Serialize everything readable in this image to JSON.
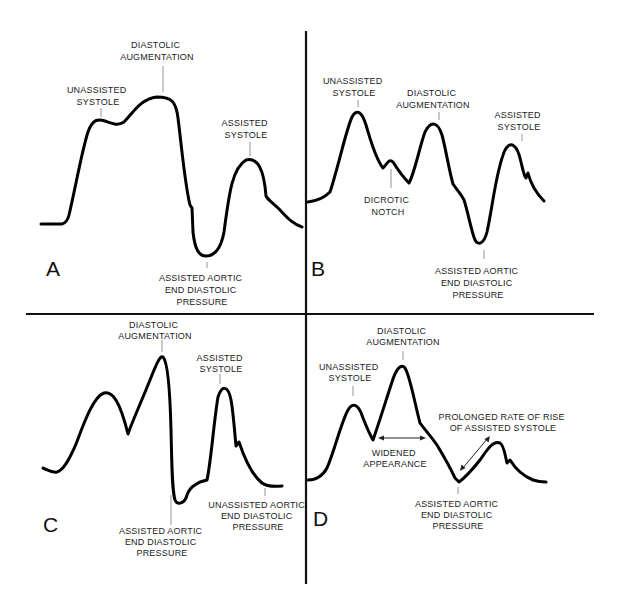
{
  "figure": {
    "panels": [
      {
        "id": "A",
        "letter": "A",
        "labels": {
          "diastolic_augmentation": [
            "DIASTOLIC",
            "AUGMENTATION"
          ],
          "unassisted_systole": [
            "UNASSISTED",
            "SYSTOLE"
          ],
          "assisted_systole": [
            "ASSISTED",
            "SYSTOLE"
          ],
          "assisted_aedp": [
            "ASSISTED AORTIC",
            "END DIASTOLIC",
            "PRESSURE"
          ]
        }
      },
      {
        "id": "B",
        "letter": "B",
        "labels": {
          "unassisted_systole": [
            "UNASSISTED",
            "SYSTOLE"
          ],
          "diastolic_augmentation": [
            "DIASTOLIC",
            "AUGMENTATION"
          ],
          "assisted_systole": [
            "ASSISTED",
            "SYSTOLE"
          ],
          "dicrotic_notch": [
            "DICROTIC",
            "NOTCH"
          ],
          "assisted_aedp": [
            "ASSISTED AORTIC",
            "END DIASTOLIC",
            "PRESSURE"
          ]
        }
      },
      {
        "id": "C",
        "letter": "C",
        "labels": {
          "diastolic_augmentation": [
            "DIASTOLIC",
            "AUGMENTATION"
          ],
          "assisted_systole": [
            "ASSISTED",
            "SYSTOLE"
          ],
          "assisted_aedp": [
            "ASSISTED AORTIC",
            "END DIASTOLIC",
            "PRESSURE"
          ],
          "unassisted_aedp": [
            "UNASSISTED AORTIC",
            "END DIASTOLIC",
            "PRESSURE"
          ]
        }
      },
      {
        "id": "D",
        "letter": "D",
        "labels": {
          "diastolic_augmentation": [
            "DIASTOLIC",
            "AUGMENTATION"
          ],
          "unassisted_systole": [
            "UNASSISTED",
            "SYSTOLE"
          ],
          "prolonged_rise": [
            "PROLONGED RATE OF RISE",
            "OF ASSISTED SYSTOLE"
          ],
          "widened": [
            "WIDENED",
            "APPEARANCE"
          ],
          "assisted_aedp": [
            "ASSISTED AORTIC",
            "END DIASTOLIC",
            "PRESSURE"
          ]
        }
      }
    ]
  },
  "colors": {
    "waveform": "#000000",
    "text": "#222222",
    "leader": "#888888",
    "background": "#ffffff"
  }
}
